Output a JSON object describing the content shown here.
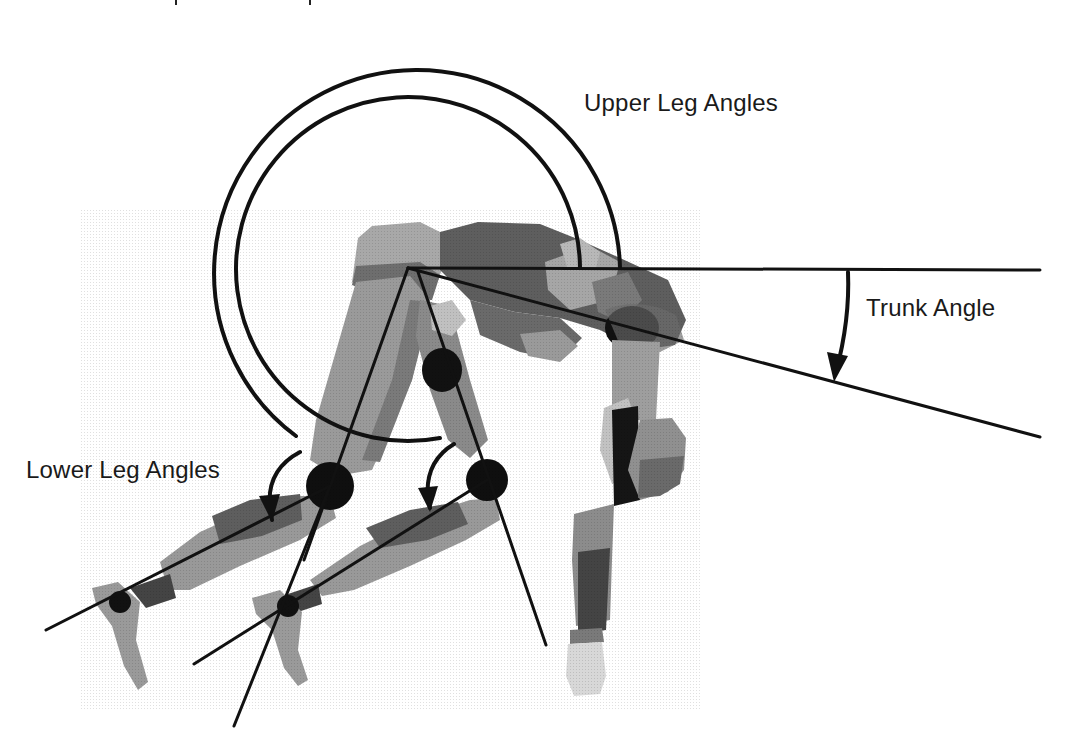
{
  "figure": {
    "type": "biomechanics-angle-diagram",
    "background": "#ffffff",
    "ink_color": "#111111",
    "labels": {
      "upper_leg_angles": "Upper Leg Angles",
      "trunk_angle": "Trunk Angle",
      "lower_leg_angles": "Lower Leg Angles"
    },
    "body_tones": {
      "light": "#b4b4b4",
      "mid": "#8a8a8a",
      "dark": "#555555",
      "joint": "#0d0d0d"
    }
  }
}
